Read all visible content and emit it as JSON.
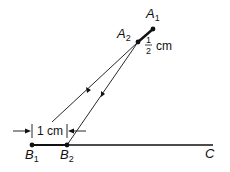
{
  "diagram": {
    "points": {
      "A1": {
        "label": "A",
        "sub": "1"
      },
      "A2": {
        "label": "A",
        "sub": "2"
      },
      "B1": {
        "label": "B",
        "sub": "1"
      },
      "B2": {
        "label": "B",
        "sub": "2"
      },
      "C": {
        "label": "C"
      }
    },
    "dimensions": {
      "top_segment": {
        "numerator": "1",
        "denominator": "2",
        "unit": "cm"
      },
      "bottom_segment": {
        "label": "1 cm"
      }
    },
    "colors": {
      "ink": "#111111",
      "background": "#ffffff"
    }
  }
}
